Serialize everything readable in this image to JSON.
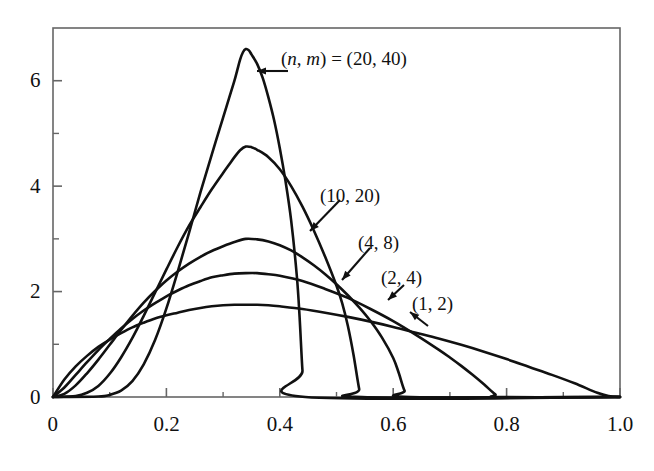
{
  "figure": {
    "background_color": "#ffffff",
    "line_color": "#111111",
    "frame_color": "#555555"
  },
  "axes": {
    "x_ticks": [
      "0",
      "0.2",
      "0.4",
      "0.6",
      "0.8",
      "1.0"
    ],
    "y_ticks": [
      "0",
      "2",
      "4",
      "6"
    ],
    "x_range": [
      0,
      1.0
    ],
    "y_range": [
      0,
      7.0
    ],
    "x_minor_step": 0.1,
    "y_minor_step": 1
  },
  "annotations": [
    {
      "id": "curve-label-20-40",
      "prefix": "(",
      "n": "n",
      "comma": ", ",
      "m": "m",
      "equals": ") = ",
      "value": "(20, 40)",
      "full_text": "(n, m) = (20, 40)"
    },
    {
      "id": "curve-label-10-20",
      "full_text": "(10, 20)"
    },
    {
      "id": "curve-label-4-8",
      "full_text": "(4, 8)"
    },
    {
      "id": "curve-label-2-4",
      "full_text": "(2, 4)"
    },
    {
      "id": "curve-label-1-2",
      "full_text": "(1, 2)"
    }
  ],
  "chart_data": {
    "type": "line",
    "title": "",
    "xlabel": "",
    "ylabel": "",
    "xlim": [
      0,
      1.0
    ],
    "ylim": [
      0,
      7.0
    ],
    "grid": false,
    "legend": "inline-annotations",
    "x_ticks": [
      0,
      0.2,
      0.4,
      0.6,
      0.8,
      1.0
    ],
    "y_ticks": [
      0,
      2,
      4,
      6
    ],
    "series": [
      {
        "name": "(1, 2)",
        "n": 1,
        "m": 2,
        "peak_x": 0.34,
        "peak_y": 1.75,
        "zero_crossing_right": 0.96,
        "points": [
          [
            0.0,
            0.0
          ],
          [
            0.02,
            0.33
          ],
          [
            0.04,
            0.58
          ],
          [
            0.06,
            0.78
          ],
          [
            0.08,
            0.95
          ],
          [
            0.1,
            1.09
          ],
          [
            0.12,
            1.21
          ],
          [
            0.14,
            1.32
          ],
          [
            0.16,
            1.41
          ],
          [
            0.18,
            1.49
          ],
          [
            0.2,
            1.55
          ],
          [
            0.22,
            1.6
          ],
          [
            0.24,
            1.65
          ],
          [
            0.26,
            1.69
          ],
          [
            0.28,
            1.72
          ],
          [
            0.3,
            1.74
          ],
          [
            0.32,
            1.75
          ],
          [
            0.34,
            1.75
          ],
          [
            0.36,
            1.75
          ],
          [
            0.38,
            1.74
          ],
          [
            0.4,
            1.72
          ],
          [
            0.44,
            1.67
          ],
          [
            0.48,
            1.6
          ],
          [
            0.52,
            1.52
          ],
          [
            0.56,
            1.43
          ],
          [
            0.6,
            1.33
          ],
          [
            0.64,
            1.22
          ],
          [
            0.68,
            1.11
          ],
          [
            0.72,
            0.99
          ],
          [
            0.76,
            0.86
          ],
          [
            0.8,
            0.72
          ],
          [
            0.84,
            0.57
          ],
          [
            0.88,
            0.42
          ],
          [
            0.92,
            0.26
          ],
          [
            0.96,
            0.08
          ],
          [
            0.98,
            0.02
          ],
          [
            1.0,
            0.0
          ]
        ]
      },
      {
        "name": "(2, 4)",
        "n": 2,
        "m": 4,
        "peak_x": 0.34,
        "peak_y": 2.35,
        "zero_crossing_right": 0.78,
        "points": [
          [
            0.0,
            0.0
          ],
          [
            0.02,
            0.18
          ],
          [
            0.04,
            0.42
          ],
          [
            0.06,
            0.66
          ],
          [
            0.08,
            0.89
          ],
          [
            0.1,
            1.1
          ],
          [
            0.12,
            1.3
          ],
          [
            0.14,
            1.48
          ],
          [
            0.16,
            1.64
          ],
          [
            0.18,
            1.78
          ],
          [
            0.2,
            1.91
          ],
          [
            0.22,
            2.02
          ],
          [
            0.24,
            2.12
          ],
          [
            0.26,
            2.2
          ],
          [
            0.28,
            2.27
          ],
          [
            0.3,
            2.31
          ],
          [
            0.32,
            2.34
          ],
          [
            0.34,
            2.35
          ],
          [
            0.36,
            2.35
          ],
          [
            0.38,
            2.33
          ],
          [
            0.4,
            2.3
          ],
          [
            0.44,
            2.2
          ],
          [
            0.48,
            2.05
          ],
          [
            0.52,
            1.88
          ],
          [
            0.56,
            1.67
          ],
          [
            0.6,
            1.44
          ],
          [
            0.64,
            1.18
          ],
          [
            0.68,
            0.9
          ],
          [
            0.7,
            0.75
          ],
          [
            0.72,
            0.59
          ],
          [
            0.74,
            0.42
          ],
          [
            0.76,
            0.24
          ],
          [
            0.78,
            0.05
          ],
          [
            0.79,
            0.0
          ],
          [
            1.0,
            0.0
          ]
        ]
      },
      {
        "name": "(4, 8)",
        "n": 4,
        "m": 8,
        "peak_x": 0.34,
        "peak_y": 3.0,
        "zero_crossing_right": 0.62,
        "points": [
          [
            0.0,
            0.0
          ],
          [
            0.02,
            0.06
          ],
          [
            0.04,
            0.22
          ],
          [
            0.06,
            0.45
          ],
          [
            0.08,
            0.71
          ],
          [
            0.1,
            0.99
          ],
          [
            0.12,
            1.27
          ],
          [
            0.14,
            1.54
          ],
          [
            0.16,
            1.79
          ],
          [
            0.18,
            2.01
          ],
          [
            0.2,
            2.21
          ],
          [
            0.22,
            2.38
          ],
          [
            0.24,
            2.53
          ],
          [
            0.26,
            2.66
          ],
          [
            0.28,
            2.77
          ],
          [
            0.3,
            2.86
          ],
          [
            0.32,
            2.94
          ],
          [
            0.34,
            3.0
          ],
          [
            0.36,
            2.99
          ],
          [
            0.38,
            2.95
          ],
          [
            0.4,
            2.88
          ],
          [
            0.42,
            2.78
          ],
          [
            0.44,
            2.65
          ],
          [
            0.46,
            2.5
          ],
          [
            0.48,
            2.33
          ],
          [
            0.5,
            2.14
          ],
          [
            0.52,
            1.93
          ],
          [
            0.54,
            1.7
          ],
          [
            0.56,
            1.44
          ],
          [
            0.58,
            1.13
          ],
          [
            0.6,
            0.74
          ],
          [
            0.61,
            0.45
          ],
          [
            0.62,
            0.12
          ],
          [
            0.63,
            0.0
          ],
          [
            1.0,
            0.0
          ]
        ]
      },
      {
        "name": "(10, 20)",
        "n": 10,
        "m": 20,
        "peak_x": 0.34,
        "peak_y": 4.75,
        "zero_crossing_right": 0.54,
        "points": [
          [
            0.0,
            0.0
          ],
          [
            0.04,
            0.02
          ],
          [
            0.06,
            0.08
          ],
          [
            0.08,
            0.21
          ],
          [
            0.1,
            0.44
          ],
          [
            0.12,
            0.75
          ],
          [
            0.14,
            1.12
          ],
          [
            0.16,
            1.54
          ],
          [
            0.18,
            1.98
          ],
          [
            0.2,
            2.42
          ],
          [
            0.22,
            2.85
          ],
          [
            0.24,
            3.25
          ],
          [
            0.26,
            3.6
          ],
          [
            0.28,
            3.94
          ],
          [
            0.3,
            4.25
          ],
          [
            0.31,
            4.4
          ],
          [
            0.32,
            4.55
          ],
          [
            0.33,
            4.68
          ],
          [
            0.34,
            4.75
          ],
          [
            0.35,
            4.74
          ],
          [
            0.36,
            4.69
          ],
          [
            0.38,
            4.55
          ],
          [
            0.4,
            4.32
          ],
          [
            0.42,
            4.0
          ],
          [
            0.44,
            3.61
          ],
          [
            0.46,
            3.16
          ],
          [
            0.48,
            2.66
          ],
          [
            0.5,
            2.11
          ],
          [
            0.51,
            1.78
          ],
          [
            0.52,
            1.35
          ],
          [
            0.53,
            0.8
          ],
          [
            0.54,
            0.15
          ],
          [
            0.545,
            0.0
          ],
          [
            1.0,
            0.0
          ]
        ]
      },
      {
        "name": "(20, 40)",
        "n": 20,
        "m": 40,
        "peak_x": 0.34,
        "peak_y": 6.6,
        "zero_crossing_right": 0.44,
        "points": [
          [
            0.0,
            0.0
          ],
          [
            0.08,
            0.01
          ],
          [
            0.1,
            0.04
          ],
          [
            0.12,
            0.12
          ],
          [
            0.14,
            0.3
          ],
          [
            0.16,
            0.62
          ],
          [
            0.18,
            1.08
          ],
          [
            0.2,
            1.68
          ],
          [
            0.22,
            2.38
          ],
          [
            0.24,
            3.12
          ],
          [
            0.26,
            3.88
          ],
          [
            0.28,
            4.6
          ],
          [
            0.3,
            5.3
          ],
          [
            0.31,
            5.65
          ],
          [
            0.32,
            6.0
          ],
          [
            0.325,
            6.2
          ],
          [
            0.33,
            6.4
          ],
          [
            0.335,
            6.54
          ],
          [
            0.34,
            6.6
          ],
          [
            0.345,
            6.58
          ],
          [
            0.35,
            6.5
          ],
          [
            0.36,
            6.32
          ],
          [
            0.37,
            6.05
          ],
          [
            0.38,
            5.68
          ],
          [
            0.39,
            5.25
          ],
          [
            0.4,
            4.72
          ],
          [
            0.41,
            4.1
          ],
          [
            0.42,
            3.35
          ],
          [
            0.43,
            2.3
          ],
          [
            0.435,
            1.5
          ],
          [
            0.44,
            0.5
          ],
          [
            0.445,
            0.0
          ],
          [
            1.0,
            0.0
          ]
        ]
      }
    ]
  },
  "annotation_positions": {
    "label_20_40": {
      "x": 281,
      "y": 48
    },
    "label_10_20": {
      "x": 320,
      "y": 185
    },
    "label_4_8": {
      "x": 358,
      "y": 232
    },
    "label_2_4": {
      "x": 381,
      "y": 267
    },
    "label_1_2": {
      "x": 412,
      "y": 293
    }
  }
}
